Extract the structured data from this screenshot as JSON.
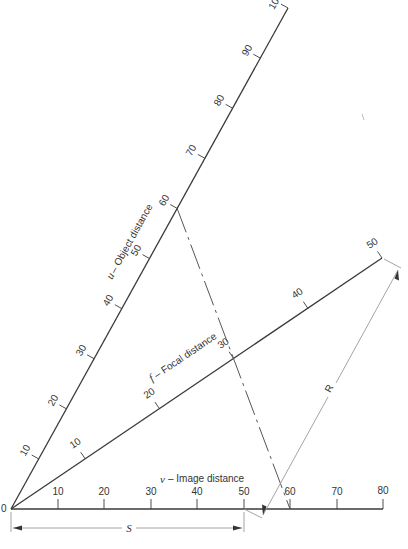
{
  "diagram": {
    "type": "nomogram",
    "origin_label": "0",
    "axes": {
      "u": {
        "symbol": "u",
        "name": "Object distance",
        "title": "u – Object distance",
        "ticks": [
          "10",
          "20",
          "30",
          "40",
          "50",
          "60",
          "70",
          "80",
          "90",
          "100"
        ]
      },
      "f": {
        "symbol": "f",
        "name": "Focal distance",
        "title": "f – Focal distance",
        "ticks": [
          "10",
          "20",
          "30",
          "40",
          "50"
        ]
      },
      "v": {
        "symbol": "v",
        "name": "Image distance",
        "title": "v – Image distance",
        "ticks": [
          "10",
          "20",
          "30",
          "40",
          "50",
          "60",
          "70",
          "80"
        ]
      }
    },
    "example_line": {
      "style": "dashed",
      "from": "u = 60",
      "through": "f = 30",
      "to": "v = 60"
    },
    "dimensions": {
      "S": {
        "label": "S",
        "from": "0",
        "to": "v = 50"
      },
      "R": {
        "label": "R",
        "from": "v = 50 extension",
        "to": "f = 50"
      }
    }
  }
}
